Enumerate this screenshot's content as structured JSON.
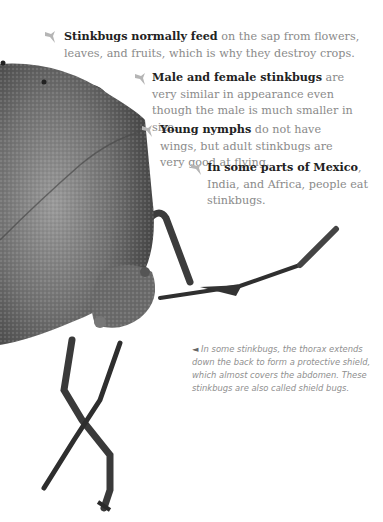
{
  "facts": [
    {
      "bold": "Stinkbugs normally feed",
      "text": " on the sap from flowers, leaves, and fruits, which is why they destroy crops."
    },
    {
      "bold": "Male and female stinkbugs",
      "text": " are very similar in appearance even though the male is much smaller in size."
    },
    {
      "bold": "Young nymphs",
      "text": " do not have wings, but adult stinkbugs are very good at flying."
    },
    {
      "bold": "In some parts of Mexico",
      "text": ", India, and Africa, people eat stinkbugs."
    }
  ],
  "caption": {
    "pointer": "◄",
    "text": " In some stinkbugs, the thorax extends down the back to form a protective shield, which almost covers the abdomen. These stinkbugs are also called shield bugs."
  },
  "colors": {
    "body_text": "#8a8a8a",
    "bold_text": "#222222",
    "bullet": "#b5b5b5",
    "bug_shell": "#6e6e6e"
  },
  "icons": {
    "bullet": "stinkbug-bullet-icon"
  }
}
